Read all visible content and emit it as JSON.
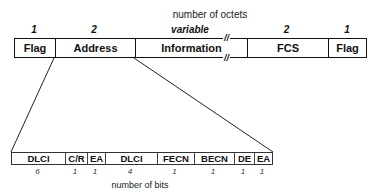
{
  "diagram": {
    "top_caption": "number of octets",
    "bottom_caption": "number of bits",
    "break_mark": "//"
  },
  "frame_fields": [
    {
      "label": "Flag",
      "octets": "1"
    },
    {
      "label": "Address",
      "octets": "2"
    },
    {
      "label": "Information",
      "octets": "variable"
    },
    {
      "label": "FCS",
      "octets": "2"
    },
    {
      "label": "Flag",
      "octets": "1"
    }
  ],
  "address_bits": [
    {
      "label": "DLCI",
      "bits": "6"
    },
    {
      "label": "C/R",
      "bits": "1"
    },
    {
      "label": "EA",
      "bits": "1"
    },
    {
      "label": "DLCI",
      "bits": "4"
    },
    {
      "label": "FECN",
      "bits": "1"
    },
    {
      "label": "BECN",
      "bits": "1"
    },
    {
      "label": "DE",
      "bits": "1"
    },
    {
      "label": "EA",
      "bits": "1"
    }
  ]
}
